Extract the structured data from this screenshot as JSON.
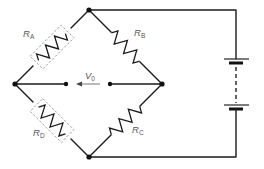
{
  "diagram": {
    "type": "circuit-schematic",
    "nodes": {
      "top": [
        89,
        10
      ],
      "bottom": [
        89,
        157
      ],
      "left": [
        15,
        84
      ],
      "right": [
        162,
        84
      ]
    },
    "resistors": [
      {
        "id": "RA",
        "label": "R",
        "subscript": "A",
        "between": [
          "left",
          "top"
        ],
        "strain_gauge": true
      },
      {
        "id": "RB",
        "label": "R",
        "subscript": "B",
        "between": [
          "top",
          "right"
        ],
        "strain_gauge": false
      },
      {
        "id": "RC",
        "label": "R",
        "subscript": "C",
        "between": [
          "right",
          "bottom"
        ],
        "strain_gauge": false
      },
      {
        "id": "RD",
        "label": "R",
        "subscript": "D",
        "between": [
          "left",
          "bottom"
        ],
        "strain_gauge": true
      }
    ],
    "output": {
      "label": "V",
      "subscript": "0",
      "direction": "left"
    },
    "source": {
      "type": "battery",
      "cells": 2,
      "connected_between": [
        "top",
        "bottom"
      ]
    },
    "colors": {
      "wire": "#1a1a1a",
      "label": "#555555",
      "gauge_outline": "#999999",
      "arrow": "#aaaaaa"
    }
  }
}
